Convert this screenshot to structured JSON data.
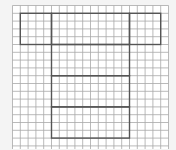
{
  "diagram": {
    "type": "grid-net",
    "grid": {
      "origin_x": 12.5,
      "origin_y": 5.5,
      "cell": 7.8,
      "cols": 20,
      "rows": 19,
      "line_color": "#a8a8a8",
      "background": "#ffffff"
    },
    "outline_color": "#555555",
    "shapes": [
      {
        "name": "left-square",
        "x": 1,
        "y": 1,
        "w": 4,
        "h": 4
      },
      {
        "name": "right-square",
        "x": 15,
        "y": 1,
        "w": 4,
        "h": 4
      },
      {
        "name": "top-rect",
        "x": 5,
        "y": 1,
        "w": 10,
        "h": 4
      },
      {
        "name": "middle-rect-1",
        "x": 5,
        "y": 5,
        "w": 10,
        "h": 4
      },
      {
        "name": "middle-rect-2",
        "x": 5,
        "y": 9,
        "w": 10,
        "h": 4
      },
      {
        "name": "bottom-rect",
        "x": 5,
        "y": 13,
        "w": 10,
        "h": 4
      }
    ]
  }
}
